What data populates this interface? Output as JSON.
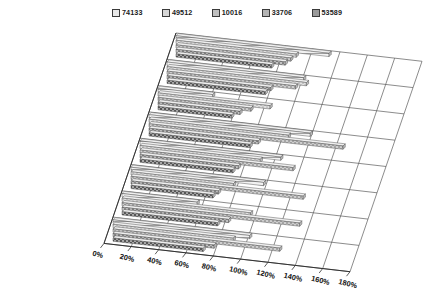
{
  "chart_data": {
    "type": "bar",
    "orientation": "horizontal",
    "style": "3d-perspective-grouped-bar",
    "title": "",
    "subtitle": "",
    "xlabel": "",
    "ylabel": "",
    "grid": true,
    "legend_position": "top",
    "xlim": [
      0,
      180
    ],
    "xunit": "%",
    "xticks": [
      "0%",
      "20%",
      "40%",
      "60%",
      "80%",
      "100%",
      "120%",
      "140%",
      "160%",
      "180%"
    ],
    "xtick_values": [
      0,
      20,
      40,
      60,
      80,
      100,
      120,
      140,
      160,
      180
    ],
    "categories": [
      "Average sale per employee",
      "Average sale $ per $ of advertising",
      "Employee turnover",
      "Average # of items purchased per customer",
      "Average purchase amount per customer",
      "Customer complaints per 100 transactions",
      "Inventory shrink % per $1000 of inventory",
      "Same store sales % – year to year"
    ],
    "series": [
      {
        "name": "74133",
        "color": "#e8e8e8",
        "pattern": "light-horizontal",
        "values": [
          112,
          100,
          40,
          118,
          103,
          97,
          55,
          100
        ]
      },
      {
        "name": "49512",
        "color": "#d6d6d6",
        "pattern": "light-dots",
        "values": [
          88,
          102,
          82,
          102,
          88,
          75,
          94,
          88
        ]
      },
      {
        "name": "10016",
        "color": "#c0c0c0",
        "pattern": "medium-dots",
        "values": [
          84,
          94,
          68,
          142,
          112,
          126,
          130,
          122
        ]
      },
      {
        "name": "33706",
        "color": "#b4b4b4",
        "pattern": "dark-dots",
        "values": [
          80,
          76,
          60,
          80,
          72,
          64,
          78,
          74
        ]
      },
      {
        "name": "53589",
        "color": "#9a9a9a",
        "pattern": "dense-dots",
        "values": [
          70,
          72,
          54,
          74,
          68,
          60,
          70,
          66
        ]
      }
    ]
  }
}
